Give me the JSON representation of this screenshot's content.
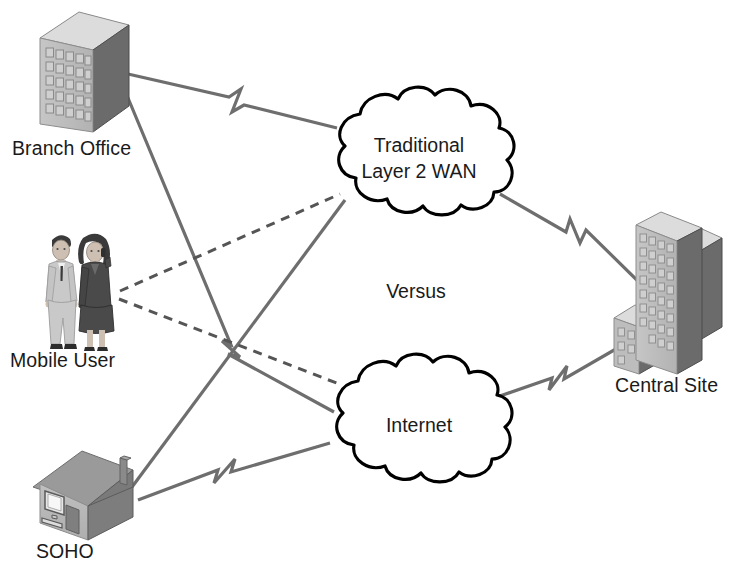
{
  "diagram": {
    "center_text": "Versus",
    "colors": {
      "line": "#6e6e6e",
      "dashed_line": "#555555",
      "cloud_outline": "#000000",
      "cloud_fill": "#ffffff",
      "text": "#1a1a1a",
      "building_front": "#bdbdbd",
      "building_side": "#6b6b6b",
      "building_top": "#d8d8d8",
      "window": "#cfcfcf",
      "window_edge": "#8a8a8a",
      "roof": "#9a9a9a",
      "roof_side": "#787878",
      "house_wall": "#b8b8b8",
      "house_side": "#7d7d7d",
      "suit_light": "#c9c9c9",
      "suit_dark": "#4a4a4a",
      "skin": "#cdbfb2",
      "hair_dark": "#3a3a3a",
      "background": "#ffffff"
    }
  },
  "clouds": [
    {
      "id": "traditional-wan",
      "name": "traditional-layer2-wan-cloud",
      "lines": [
        "Traditional",
        "Layer 2 WAN"
      ],
      "label_line1": "Traditional",
      "label_line2": "Layer 2 WAN",
      "cx": 419,
      "cy": 158
    },
    {
      "id": "internet",
      "name": "internet-cloud",
      "lines": [
        "Internet"
      ],
      "label_line1": "Internet",
      "cx": 419,
      "cy": 424
    }
  ],
  "nodes": [
    {
      "id": "branch-office",
      "label": "Branch Office",
      "icon": "office-building-icon",
      "x": 40,
      "y": 12,
      "label_x": 12,
      "label_y": 155
    },
    {
      "id": "mobile-user",
      "label": "Mobile User",
      "icon": "two-people-icon",
      "x": 40,
      "y": 228,
      "label_x": 10,
      "label_y": 367
    },
    {
      "id": "soho",
      "label": "SOHO",
      "icon": "house-with-computer-icon",
      "x": 32,
      "y": 448,
      "label_x": 36,
      "label_y": 558
    },
    {
      "id": "central-site",
      "label": "Central Site",
      "icon": "office-buildings-icon",
      "x": 614,
      "y": 212,
      "label_x": 615,
      "label_y": 392
    }
  ],
  "links": [
    {
      "id": "branch-to-wan",
      "from": "branch-office",
      "to": "traditional-wan",
      "style": "solid",
      "marker": "serial-zigzag"
    },
    {
      "id": "branch-to-internet",
      "from": "branch-office",
      "to": "internet",
      "style": "solid",
      "marker": "serial-zigzag"
    },
    {
      "id": "mobile-to-wan",
      "from": "mobile-user",
      "to": "traditional-wan",
      "style": "dashed",
      "marker": "none"
    },
    {
      "id": "mobile-to-internet",
      "from": "mobile-user",
      "to": "internet",
      "style": "dashed",
      "marker": "none"
    },
    {
      "id": "soho-to-wan",
      "from": "soho",
      "to": "traditional-wan",
      "style": "solid",
      "marker": "none"
    },
    {
      "id": "soho-to-internet",
      "from": "soho",
      "to": "internet",
      "style": "solid",
      "marker": "serial-zigzag"
    },
    {
      "id": "wan-to-central",
      "from": "traditional-wan",
      "to": "central-site",
      "style": "solid",
      "marker": "serial-zigzag"
    },
    {
      "id": "internet-to-central",
      "from": "internet",
      "to": "central-site",
      "style": "solid",
      "marker": "serial-zigzag"
    }
  ]
}
